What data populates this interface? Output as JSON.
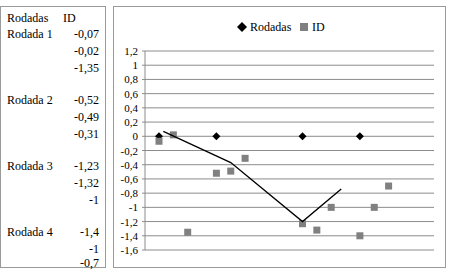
{
  "table": {
    "headers": [
      "Rodadas",
      "ID"
    ],
    "groups": [
      {
        "label": "Rodada 1",
        "values": [
          "-0,07",
          "-0,02",
          "-1,35"
        ]
      },
      {
        "label": "Rodada 2",
        "values": [
          "-0,52",
          "-0,49",
          "-0,31"
        ]
      },
      {
        "label": "Rodada 3",
        "values": [
          "-1,23",
          "-1,32",
          "-1"
        ]
      },
      {
        "label": "Rodada 4",
        "values": [
          "-1,4",
          "-1",
          "-0,7"
        ]
      }
    ]
  },
  "chart_data": {
    "type": "scatter",
    "title": "",
    "xlabel": "",
    "ylabel": "",
    "ylim": [
      -1.6,
      1.2
    ],
    "yticks": [
      "1,2",
      "1",
      "0,8",
      "0,6",
      "0,4",
      "0,2",
      "0",
      "-0,2",
      "-0,4",
      "-0,6",
      "-0,8",
      "-1",
      "-1,2",
      "-1,4",
      "-1,6"
    ],
    "grid": true,
    "legend": {
      "position": "top",
      "entries": [
        "Rodadas",
        "ID"
      ]
    },
    "series": [
      {
        "name": "Rodadas",
        "marker": "diamond",
        "color": "#000000",
        "x": [
          1,
          5,
          11,
          15
        ],
        "y": [
          0,
          0,
          0,
          0
        ]
      },
      {
        "name": "ID",
        "marker": "square",
        "color": "#808080",
        "x": [
          1,
          2,
          3,
          5,
          6,
          7,
          11,
          12,
          13,
          15,
          16,
          17
        ],
        "y": [
          -0.07,
          0.02,
          -1.35,
          -0.52,
          -0.49,
          -0.31,
          -1.23,
          -1.32,
          -1.0,
          -1.4,
          -1.0,
          -0.7
        ]
      },
      {
        "name": "Trend",
        "type": "line",
        "color": "#000000",
        "x": [
          1.3,
          6,
          11,
          13.7
        ],
        "y": [
          0.07,
          -0.37,
          -1.2,
          -0.74
        ]
      }
    ]
  }
}
